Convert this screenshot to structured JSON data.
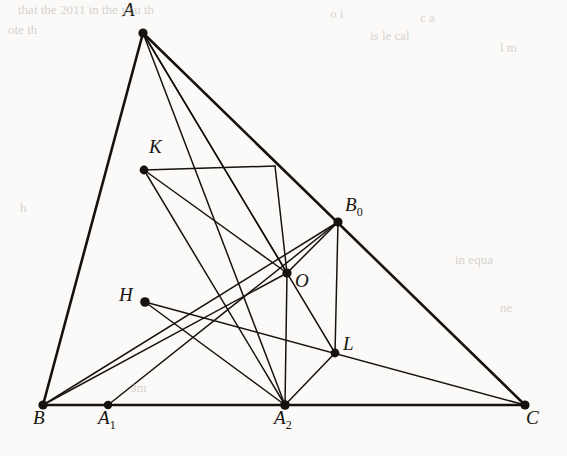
{
  "figure": {
    "type": "geometric-diagram",
    "background_color": "#fbfaf8",
    "ink_color": "#16130f",
    "canvas": {
      "width": 567,
      "height": 456
    },
    "points": [
      {
        "id": "A",
        "label": "A",
        "sub": "",
        "x": 143,
        "y": 33,
        "label_dx": -20,
        "label_dy": -22,
        "dot_r": 4.6
      },
      {
        "id": "B",
        "label": "B",
        "sub": "",
        "x": 43,
        "y": 405,
        "label_dx": -10,
        "label_dy": 14,
        "dot_r": 4.6
      },
      {
        "id": "C",
        "label": "C",
        "sub": "",
        "x": 525,
        "y": 405,
        "label_dx": 1,
        "label_dy": 14,
        "dot_r": 4.6
      },
      {
        "id": "A1",
        "label": "A",
        "sub": "1",
        "x": 108,
        "y": 405,
        "label_dx": -10,
        "label_dy": 14,
        "dot_r": 4.2
      },
      {
        "id": "A2",
        "label": "A",
        "sub": "2",
        "x": 285,
        "y": 405,
        "label_dx": -11,
        "label_dy": 14,
        "dot_r": 4.8
      },
      {
        "id": "K",
        "label": "K",
        "sub": "",
        "x": 144,
        "y": 170,
        "label_dx": 5,
        "label_dy": -22,
        "dot_r": 4.4
      },
      {
        "id": "H",
        "label": "H",
        "sub": "",
        "x": 145,
        "y": 302,
        "label_dx": -26,
        "label_dy": -6,
        "dot_r": 4.8
      },
      {
        "id": "O",
        "label": "O",
        "sub": "",
        "x": 287,
        "y": 273,
        "label_dx": 8,
        "label_dy": 9,
        "dot_r": 4.6
      },
      {
        "id": "B0",
        "label": "B",
        "sub": "0",
        "x": 338,
        "y": 222,
        "label_dx": 7,
        "label_dy": -16,
        "dot_r": 4.6
      },
      {
        "id": "L",
        "label": "L",
        "sub": "",
        "x": 335,
        "y": 353,
        "label_dx": 8,
        "label_dy": -8,
        "dot_r": 4.4
      },
      {
        "id": "P",
        "label": "",
        "sub": "",
        "x": 275,
        "y": 166,
        "label_dx": 0,
        "label_dy": 0,
        "dot_r": 0
      }
    ],
    "segments": [
      {
        "from": "A",
        "to": "B",
        "weight": 2.6,
        "name": "side-AB"
      },
      {
        "from": "B",
        "to": "C",
        "weight": 2.6,
        "name": "side-BC"
      },
      {
        "from": "A",
        "to": "C",
        "weight": 2.6,
        "name": "side-AC"
      },
      {
        "from": "A",
        "to": "A2",
        "weight": 1.5,
        "name": "altitude-A-A2"
      },
      {
        "from": "A",
        "to": "O",
        "weight": 1.5,
        "name": "cevian-A-O"
      },
      {
        "from": "A",
        "to": "L",
        "weight": 1.5,
        "name": "cevian-A-L"
      },
      {
        "from": "B",
        "to": "O",
        "weight": 1.5,
        "name": "cevian-B-H-O"
      },
      {
        "from": "B",
        "to": "B0",
        "weight": 1.5,
        "name": "cevian-B-B0"
      },
      {
        "from": "A1",
        "to": "B0",
        "weight": 1.5,
        "name": "cevian-A1-B0"
      },
      {
        "from": "H",
        "to": "C",
        "weight": 1.5,
        "name": "line-H-L-C"
      },
      {
        "from": "H",
        "to": "A2",
        "weight": 1.5,
        "name": "segment-H-A2"
      },
      {
        "from": "K",
        "to": "O",
        "weight": 1.5,
        "name": "segment-K-O"
      },
      {
        "from": "K",
        "to": "A2",
        "weight": 1.5,
        "name": "segment-K-A2"
      },
      {
        "from": "K",
        "to": "P",
        "weight": 1.5,
        "name": "segment-K-to-AC"
      },
      {
        "from": "P",
        "to": "O",
        "weight": 1.5,
        "name": "segment-AC-to-O"
      },
      {
        "from": "O",
        "to": "A2",
        "weight": 1.5,
        "name": "perpendicular-O-A2"
      },
      {
        "from": "O",
        "to": "B0",
        "weight": 1.5,
        "name": "segment-O-B0"
      },
      {
        "from": "B0",
        "to": "L",
        "weight": 1.5,
        "name": "perpendicular-B0-L"
      },
      {
        "from": "L",
        "to": "A2",
        "weight": 1.5,
        "name": "segment-L-A2"
      }
    ]
  },
  "scan_bleed": [
    {
      "text": "that the 2011 in the  you th",
      "x": 18,
      "y": 2
    },
    {
      "text": "ote th",
      "x": 8,
      "y": 22
    },
    {
      "text": "o  i",
      "x": 330,
      "y": 6
    },
    {
      "text": "c  a",
      "x": 420,
      "y": 10
    },
    {
      "text": "is  le cal",
      "x": 370,
      "y": 28
    },
    {
      "text": "l  m",
      "x": 500,
      "y": 40
    },
    {
      "text": "h",
      "x": 20,
      "y": 200
    },
    {
      "text": "in  equa",
      "x": 455,
      "y": 252
    },
    {
      "text": "ne",
      "x": 500,
      "y": 300
    },
    {
      "text": "3m",
      "x": 130,
      "y": 380
    }
  ]
}
